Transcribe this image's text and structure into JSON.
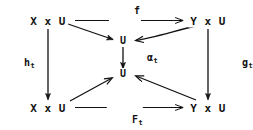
{
  "diagram": {
    "kind": "commutative-diagram",
    "width": 253,
    "height": 130,
    "background_color": "#ffffff",
    "ink_color": "#121212",
    "nodes": [
      {
        "id": "top-left",
        "label": "X x U",
        "x": 48,
        "y": 21
      },
      {
        "id": "top-right",
        "label": "Y x U",
        "x": 208,
        "y": 21
      },
      {
        "id": "center-upper",
        "label": "U",
        "x": 123,
        "y": 41
      },
      {
        "id": "center-lower",
        "label": "U",
        "x": 123,
        "y": 74
      },
      {
        "id": "bottom-left",
        "label": "X x U",
        "x": 48,
        "y": 108
      },
      {
        "id": "bottom-right",
        "label": "Y x U",
        "x": 208,
        "y": 108
      }
    ],
    "edges": [
      {
        "id": "f",
        "label": "f",
        "sub": "",
        "from": "top-left",
        "to": "top-right",
        "label_x": 125,
        "label_y": 11
      },
      {
        "id": "h",
        "label": "h",
        "sub": "t",
        "from": "top-left",
        "to": "bottom-left",
        "label_x": 17,
        "label_y": 63
      },
      {
        "id": "g",
        "label": "g",
        "sub": "t",
        "from": "top-right",
        "to": "bottom-right",
        "label_x": 235,
        "label_y": 63
      },
      {
        "id": "alpha",
        "label": "α",
        "sub": "t",
        "from": "center-upper",
        "to": "center-lower",
        "label_x": 140,
        "label_y": 58
      },
      {
        "id": "F",
        "label": "F",
        "sub": "t",
        "from": "bottom-left",
        "to": "bottom-right",
        "label_x": 125,
        "label_y": 120
      },
      {
        "id": "d-tl-u",
        "label": "",
        "sub": "",
        "from": "top-left",
        "to": "center-upper",
        "label_x": 0,
        "label_y": 0
      },
      {
        "id": "d-tr-u",
        "label": "",
        "sub": "",
        "from": "top-right",
        "to": "center-upper",
        "label_x": 0,
        "label_y": 0
      },
      {
        "id": "d-bl-u",
        "label": "",
        "sub": "",
        "from": "bottom-left",
        "to": "center-lower",
        "label_x": 0,
        "label_y": 0
      },
      {
        "id": "d-br-u",
        "label": "",
        "sub": "",
        "from": "bottom-right",
        "to": "center-lower",
        "label_x": 0,
        "label_y": 0
      }
    ]
  }
}
